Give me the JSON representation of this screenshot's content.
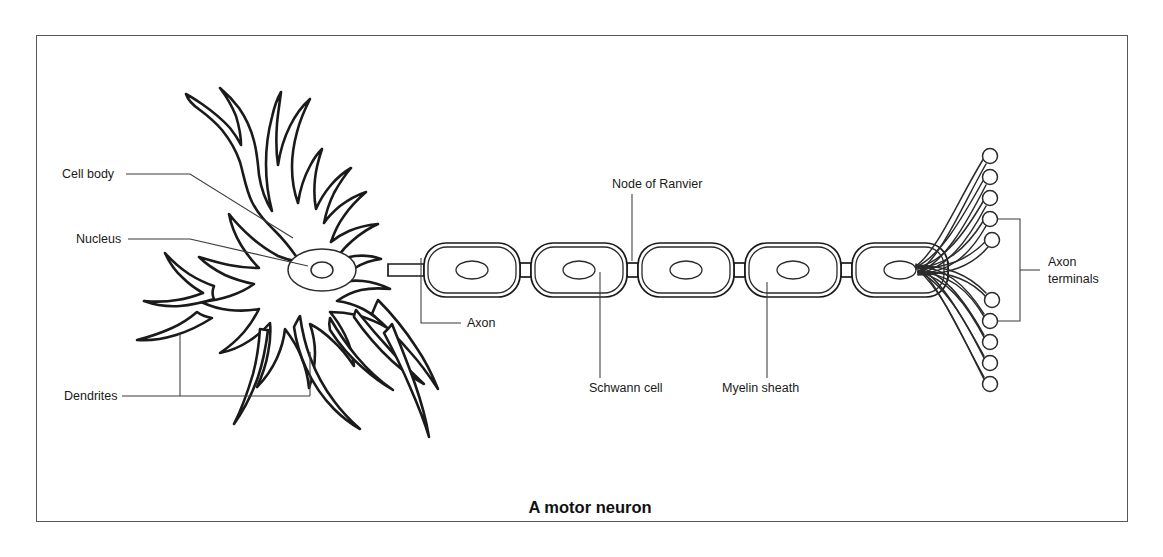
{
  "figure": {
    "caption": "A motor neuron",
    "caption_x": 590,
    "caption_y": 513,
    "frame": {
      "x": 36,
      "y": 35,
      "width": 1092,
      "height": 487
    },
    "background_color": "#ffffff",
    "border_color": "#58585a",
    "ink_color": "#1a1a1a",
    "leader_color": "#3a3a3a"
  },
  "labels": {
    "cell_body": {
      "text": "Cell body",
      "x": 62,
      "y": 178,
      "anchor": "start"
    },
    "nucleus": {
      "text": "Nucleus",
      "x": 76,
      "y": 243,
      "anchor": "start"
    },
    "dendrites": {
      "text": "Dendrites",
      "x": 64,
      "y": 400,
      "anchor": "start"
    },
    "axon": {
      "text": "Axon",
      "x": 467,
      "y": 327,
      "anchor": "start"
    },
    "node_of_ranvier": {
      "text": "Node of Ranvier",
      "x": 612,
      "y": 188,
      "anchor": "start"
    },
    "schwann_cell": {
      "text": "Schwann cell",
      "x": 589,
      "y": 392,
      "anchor": "start"
    },
    "myelin_sheath": {
      "text": "Myelin sheath",
      "x": 722,
      "y": 392,
      "anchor": "start"
    },
    "axon_terminals_line1": {
      "text": "Axon",
      "x": 1048,
      "y": 266,
      "anchor": "start"
    },
    "axon_terminals_line2": {
      "text": "terminals",
      "x": 1048,
      "y": 283,
      "anchor": "start"
    }
  },
  "diagram": {
    "soma": {
      "nucleus": {
        "cx": 322,
        "cy": 270,
        "rx": 34,
        "ry": 21
      },
      "nucleolus": {
        "cx": 322,
        "cy": 270,
        "rx": 11,
        "ry": 8
      }
    },
    "myelin_segments": [
      {
        "x": 424,
        "width": 96
      },
      {
        "x": 531,
        "width": 96
      },
      {
        "x": 638,
        "width": 96
      },
      {
        "x": 745,
        "width": 96
      },
      {
        "x": 852,
        "width": 96
      }
    ],
    "segment_y": 243,
    "segment_height": 54,
    "schwann_nucleus_rx": 16,
    "schwann_nucleus_ry": 9,
    "node_width": 11,
    "axon_center_y": 270,
    "terminal_bulbs": [
      {
        "cx": 990,
        "cy": 156
      },
      {
        "cx": 990,
        "cy": 177
      },
      {
        "cx": 990,
        "cy": 198
      },
      {
        "cx": 990,
        "cy": 219
      },
      {
        "cx": 992,
        "cy": 240
      },
      {
        "cx": 992,
        "cy": 300
      },
      {
        "cx": 990,
        "cy": 321
      },
      {
        "cx": 990,
        "cy": 342
      },
      {
        "cx": 990,
        "cy": 363
      },
      {
        "cx": 990,
        "cy": 384
      }
    ],
    "terminal_bulb_radius": 7.5,
    "terminal_fan_origin": {
      "x": 915,
      "y": 270
    },
    "terminal_bracket": {
      "x": 1020,
      "top": 219,
      "bottom": 321,
      "tick_y": 270,
      "tick_x": 1040
    },
    "dendrite_bracket": {
      "y": 396,
      "left": 130,
      "right": 310,
      "riser_x": 180,
      "riser_top": 334,
      "riser_right_top": 352
    }
  }
}
